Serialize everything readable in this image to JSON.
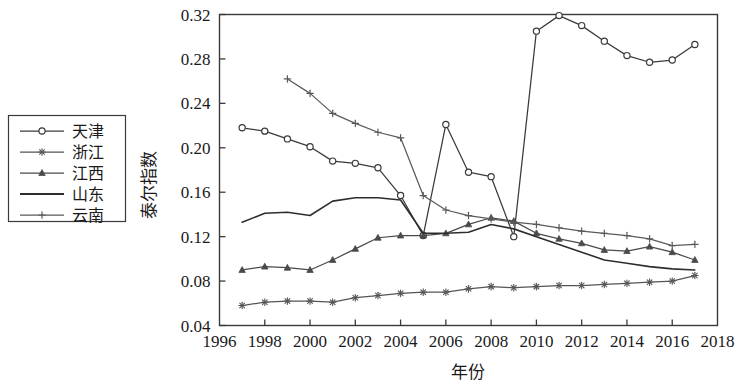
{
  "chart_data": {
    "type": "line",
    "title": "",
    "xlabel": "年份",
    "ylabel": "泰尔指数",
    "xlim": [
      1996,
      2018
    ],
    "ylim": [
      0.04,
      0.32
    ],
    "xticks": [
      1996,
      1998,
      2000,
      2002,
      2004,
      2006,
      2008,
      2010,
      2012,
      2014,
      2016,
      2018
    ],
    "yticks": [
      0.04,
      0.08,
      0.12,
      0.16,
      0.2,
      0.24,
      0.28,
      0.32
    ],
    "ytick_labels": [
      "0.04",
      "0.08",
      "0.12",
      "0.16",
      "0.20",
      "0.24",
      "0.28",
      "0.32"
    ],
    "xtick_labels": [
      "1996",
      "1998",
      "2000",
      "2002",
      "2004",
      "2006",
      "2008",
      "2010",
      "2012",
      "2014",
      "2016",
      "2018"
    ],
    "grid": false,
    "legend_position": "left-outside",
    "series": [
      {
        "name": "天津",
        "marker": "circle",
        "color": "#3a3a3a",
        "x": [
          1997,
          1998,
          1999,
          2000,
          2001,
          2002,
          2003,
          2004,
          2005,
          2006,
          2007,
          2008,
          2009,
          2010,
          2011,
          2012,
          2013,
          2014,
          2015,
          2016,
          2017
        ],
        "values": [
          0.218,
          0.215,
          0.208,
          0.201,
          0.188,
          0.186,
          0.182,
          0.157,
          0.121,
          0.221,
          0.178,
          0.174,
          0.12,
          0.305,
          0.319,
          0.31,
          0.296,
          0.283,
          0.277,
          0.279,
          0.293
        ]
      },
      {
        "name": "浙江",
        "marker": "asterisk",
        "color": "#555555",
        "x": [
          1997,
          1998,
          1999,
          2000,
          2001,
          2002,
          2003,
          2004,
          2005,
          2006,
          2007,
          2008,
          2009,
          2010,
          2011,
          2012,
          2013,
          2014,
          2015,
          2016,
          2017
        ],
        "values": [
          0.058,
          0.061,
          0.062,
          0.062,
          0.061,
          0.065,
          0.067,
          0.069,
          0.07,
          0.07,
          0.073,
          0.075,
          0.074,
          0.075,
          0.076,
          0.076,
          0.077,
          0.078,
          0.079,
          0.08,
          0.085
        ]
      },
      {
        "name": "江西",
        "marker": "triangle",
        "color": "#4a4a4a",
        "x": [
          1997,
          1998,
          1999,
          2000,
          2001,
          2002,
          2003,
          2004,
          2005,
          2006,
          2007,
          2008,
          2009,
          2010,
          2011,
          2012,
          2013,
          2014,
          2015,
          2016,
          2017
        ],
        "values": [
          0.09,
          0.093,
          0.092,
          0.09,
          0.099,
          0.109,
          0.119,
          0.121,
          0.121,
          0.123,
          0.131,
          0.137,
          0.134,
          0.123,
          0.118,
          0.114,
          0.108,
          0.107,
          0.111,
          0.106,
          0.099
        ]
      },
      {
        "name": "山东",
        "marker": "none",
        "color": "#2e2e2e",
        "x": [
          1997,
          1998,
          1999,
          2000,
          2001,
          2002,
          2003,
          2004,
          2005,
          2006,
          2007,
          2008,
          2009,
          2010,
          2011,
          2012,
          2013,
          2014,
          2015,
          2016,
          2017
        ],
        "values": [
          0.133,
          0.141,
          0.142,
          0.139,
          0.152,
          0.155,
          0.155,
          0.153,
          0.123,
          0.123,
          0.124,
          0.131,
          0.127,
          0.12,
          0.113,
          0.106,
          0.099,
          0.096,
          0.093,
          0.091,
          0.09
        ]
      },
      {
        "name": "云南",
        "marker": "plus",
        "color": "#5a5a5a",
        "x": [
          1999,
          2000,
          2001,
          2002,
          2003,
          2004,
          2005,
          2006,
          2007,
          2008,
          2009,
          2010,
          2011,
          2012,
          2013,
          2014,
          2015,
          2016,
          2017
        ],
        "values": [
          0.262,
          0.249,
          0.231,
          0.222,
          0.214,
          0.209,
          0.157,
          0.144,
          0.139,
          0.136,
          0.133,
          0.131,
          0.128,
          0.125,
          0.123,
          0.121,
          0.118,
          0.112,
          0.113
        ]
      }
    ]
  },
  "legend": {
    "items": [
      {
        "label": "天津"
      },
      {
        "label": "浙江"
      },
      {
        "label": "江西"
      },
      {
        "label": "山东"
      },
      {
        "label": "云南"
      }
    ]
  }
}
